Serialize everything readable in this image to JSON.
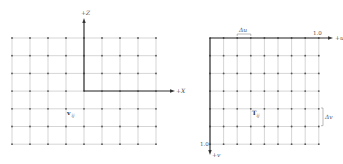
{
  "left_diagram": {
    "title": "World space grid",
    "z_axis_label": "+Z",
    "x_axis_label": "+X",
    "point_label": "v",
    "point_subscript": "ij",
    "grid": {
      "cols": 9,
      "rows": 7,
      "x0": 12,
      "dx": 18,
      "y0": 38,
      "dy": 17.7
    },
    "axis_origin": {
      "x": 84,
      "y": 91
    },
    "point_position": {
      "x": 66,
      "y": 108
    }
  },
  "right_diagram": {
    "title": "Texture space grid",
    "u_axis_label": "+u",
    "v_axis_label": "+v",
    "u_max_label": "1.0",
    "v_max_label": "1.0",
    "du_label": "Δu",
    "dv_label": "Δv",
    "point_label": "T",
    "point_subscript": "ij",
    "grid": {
      "cols": 9,
      "rows": 7,
      "x0": 210,
      "dx": 13.6,
      "y0": 38,
      "dy": 17.7
    },
    "point_position": {
      "x": 251,
      "y": 108
    }
  },
  "colors": {
    "grid": "#b8b8b8",
    "axis": "#333333",
    "dot": "#555555",
    "text": "#555555"
  }
}
